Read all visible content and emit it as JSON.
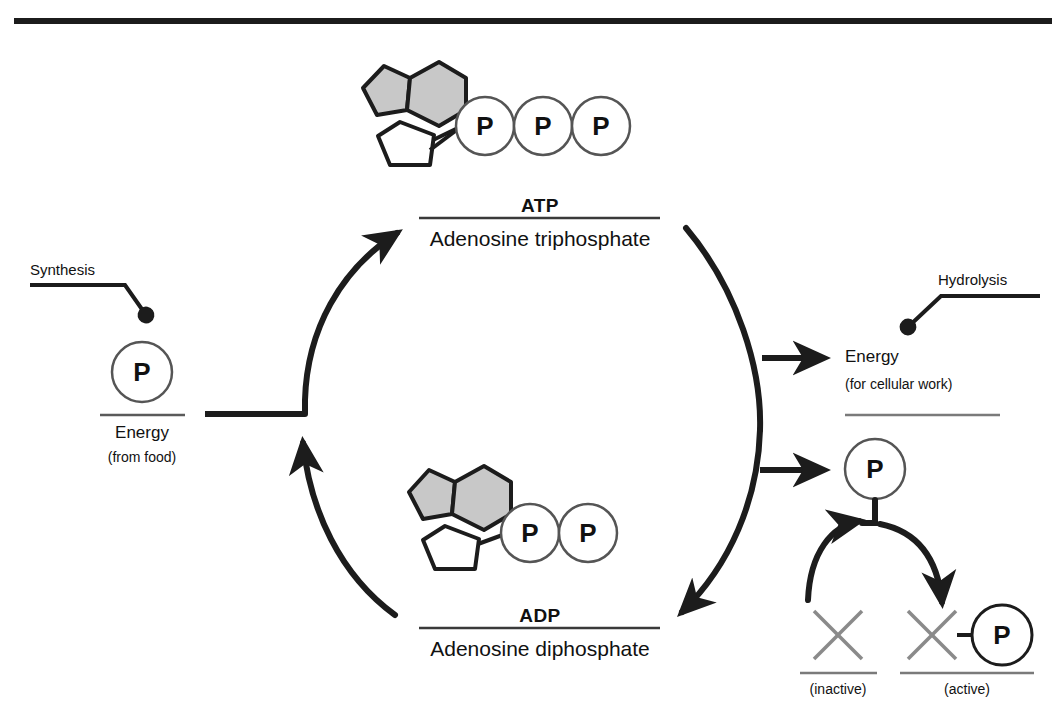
{
  "figure": {
    "type": "diagram",
    "background_color": "#ffffff",
    "ink_color": "#1c1c1c",
    "shade_color": "#c8c8c8"
  },
  "molecules": {
    "atp": {
      "name_abbrev": "ATP",
      "name_full": "Adenosine triphosphate",
      "phosphate_count": 3,
      "phosphate_letter": "P",
      "parts": [
        "adenine-pentagon",
        "adenine-hexagon",
        "ribose-pentagon"
      ]
    },
    "adp": {
      "name_abbrev": "ADP",
      "name_full": "Adenosine diphosphate",
      "phosphate_count": 2,
      "phosphate_letter": "P",
      "parts": [
        "adenine-pentagon",
        "adenine-hexagon",
        "ribose-pentagon"
      ]
    }
  },
  "left": {
    "callout": "Synthesis",
    "phosphate_letter": "P",
    "energy_line1": "Energy",
    "energy_line2": "(from food)"
  },
  "right": {
    "callout": "Hydrolysis",
    "energy_line1": "Energy",
    "energy_line2": "(for cellular work)",
    "phosphate_letter": "P",
    "inactive_symbol": "X",
    "inactive_label": "(inactive)",
    "active_symbol": "X",
    "active_phosphate_letter": "P",
    "active_label": "(active)"
  }
}
